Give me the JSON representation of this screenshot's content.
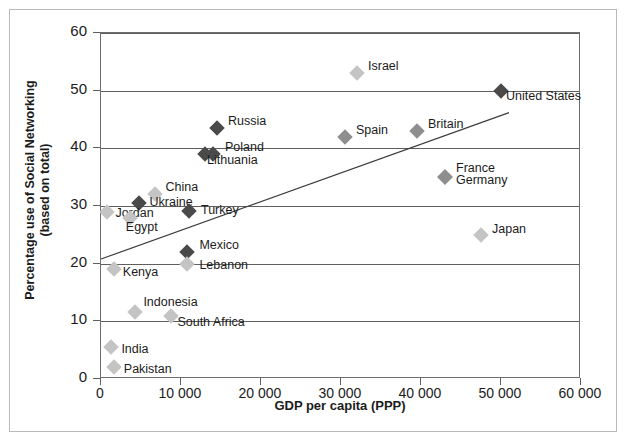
{
  "chart_data": {
    "type": "scatter",
    "title": "",
    "xlabel": "GDP per capita (PPP)",
    "ylabel": "Percentage use of Social Networking\n(based on total)",
    "xlim": [
      0,
      60000
    ],
    "ylim": [
      0,
      60
    ],
    "xticks": [
      "0",
      "10 000",
      "20 000",
      "30 000",
      "40 000",
      "50 000",
      "60 000"
    ],
    "xtick_values": [
      0,
      10000,
      20000,
      30000,
      40000,
      50000,
      60000
    ],
    "yticks": [
      "0",
      "10",
      "20",
      "30",
      "40",
      "50",
      "60"
    ],
    "ytick_values": [
      0,
      10,
      20,
      30,
      40,
      50,
      60
    ],
    "grid": "horizontal",
    "legend": "none",
    "marker_shape": "diamond",
    "points": [
      {
        "label": "Israel",
        "x": 32000,
        "y": 53,
        "shade": "light",
        "label_dx": 11,
        "label_dy": -7
      },
      {
        "label": "United States",
        "x": 50000,
        "y": 50,
        "shade": "dark",
        "label_dx": 5,
        "label_dy": 5
      },
      {
        "label": "Russia",
        "x": 14500,
        "y": 43.5,
        "shade": "dark",
        "label_dx": 11,
        "label_dy": -7
      },
      {
        "label": "Spain",
        "x": 30500,
        "y": 42,
        "shade": "mid",
        "label_dx": 11,
        "label_dy": -7
      },
      {
        "label": "Britain",
        "x": 39500,
        "y": 43,
        "shade": "mid",
        "label_dx": 11,
        "label_dy": -7
      },
      {
        "label": "Poland",
        "x": 13000,
        "y": 39,
        "shade": "dark",
        "label_dx": 20,
        "label_dy": -7
      },
      {
        "label": "Lithuania",
        "x": 14000,
        "y": 39,
        "shade": "dark",
        "label_dx": -6,
        "label_dy": 6
      },
      {
        "label": "France",
        "x": 43000,
        "y": 35,
        "shade": "mid",
        "label_dx": 11,
        "label_dy": -9
      },
      {
        "label": "Germany",
        "x": 43000,
        "y": 35,
        "shade": "mid",
        "label_dx": 11,
        "label_dy": 3
      },
      {
        "label": "China",
        "x": 6700,
        "y": 32,
        "shade": "light",
        "label_dx": 11,
        "label_dy": -7
      },
      {
        "label": "Ukraine",
        "x": 4700,
        "y": 30.5,
        "shade": "dark",
        "label_dx": 11,
        "label_dy": -1
      },
      {
        "label": "Jordan",
        "x": 800,
        "y": 29,
        "shade": "light",
        "label_dx": 8,
        "label_dy": 1
      },
      {
        "label": "Egypt",
        "x": 3600,
        "y": 28,
        "shade": "light",
        "label_dx": -4,
        "label_dy": 9
      },
      {
        "label": "Turkey",
        "x": 11000,
        "y": 29.2,
        "shade": "dark",
        "label_dx": 12,
        "label_dy": -1
      },
      {
        "label": "Japan",
        "x": 47500,
        "y": 25,
        "shade": "light",
        "label_dx": 11,
        "label_dy": -6
      },
      {
        "label": "Mexico",
        "x": 10800,
        "y": 22,
        "shade": "dark",
        "label_dx": 12,
        "label_dy": -7
      },
      {
        "label": "Lebanon",
        "x": 10800,
        "y": 20,
        "shade": "light",
        "label_dx": 12,
        "label_dy": 1
      },
      {
        "label": "Kenya",
        "x": 1600,
        "y": 19,
        "shade": "light",
        "label_dx": 9,
        "label_dy": 3
      },
      {
        "label": "Indonesia",
        "x": 4300,
        "y": 11.7,
        "shade": "light",
        "label_dx": 8,
        "label_dy": -10
      },
      {
        "label": "South Africa",
        "x": 8800,
        "y": 11,
        "shade": "light",
        "label_dx": 6,
        "label_dy": 6
      },
      {
        "label": "India",
        "x": 1300,
        "y": 5.5,
        "shade": "light",
        "label_dx": 10,
        "label_dy": 2
      },
      {
        "label": "Pakistan",
        "x": 1600,
        "y": 2,
        "shade": "light",
        "label_dx": 10,
        "label_dy": 2
      }
    ],
    "trendline": {
      "label": "linear trend",
      "x_start": 0,
      "y_start": 20.8,
      "x_end": 51000,
      "y_end": 46.2
    }
  },
  "colors": {
    "marker_dark": "#4a4a4a",
    "marker_mid": "#8e8e8e",
    "marker_light": "#c4c4c4",
    "axis": "#5f5f5f",
    "text": "#1b1b1b",
    "background": "#ffffff"
  }
}
